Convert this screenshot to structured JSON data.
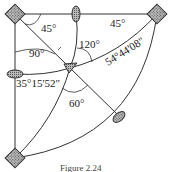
{
  "diagram": {
    "angles": {
      "top_left": "45°",
      "top_right": "45°",
      "left_center": "90°",
      "upper_center": "120°",
      "lower_center": "60°",
      "right_arc": "54°44'08\"",
      "left_arc": "35°15'52\""
    },
    "caption": "Figure 2.24"
  }
}
